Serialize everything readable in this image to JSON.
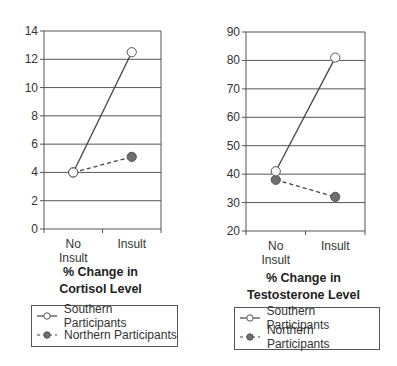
{
  "chart_data": [
    {
      "type": "line",
      "title": "% Change in Cortisol Level",
      "title_lines": [
        "% Change in",
        "Cortisol Level"
      ],
      "xlabel": "",
      "ylabel": "",
      "categories": [
        "No Insult",
        "Insult"
      ],
      "category_lines": [
        [
          "No",
          "Insult"
        ],
        [
          "Insult"
        ]
      ],
      "ylim": [
        0,
        14
      ],
      "yticks": [
        0,
        2,
        4,
        6,
        8,
        10,
        12,
        14
      ],
      "grid": true,
      "legend_position": "bottom",
      "series": [
        {
          "name": "Southern Participants",
          "values": [
            4,
            12.5
          ],
          "marker": "open-circle",
          "line": "solid"
        },
        {
          "name": "Northern Participants",
          "values": [
            4,
            5.1
          ],
          "marker": "filled-circle",
          "line": "dashed"
        }
      ]
    },
    {
      "type": "line",
      "title": "% Change in Testosterone Level",
      "title_lines": [
        "% Change in",
        "Testosterone Level"
      ],
      "xlabel": "",
      "ylabel": "",
      "categories": [
        "No Insult",
        "Insult"
      ],
      "category_lines": [
        [
          "No",
          "Insult"
        ],
        [
          "Insult"
        ]
      ],
      "ylim": [
        20,
        90
      ],
      "yticks": [
        20,
        30,
        40,
        50,
        60,
        70,
        80,
        90
      ],
      "grid": true,
      "legend_position": "bottom",
      "series": [
        {
          "name": "Southern Participants",
          "values": [
            41,
            81
          ],
          "marker": "open-circle",
          "line": "solid"
        },
        {
          "name": "Northern Participants",
          "values": [
            38,
            32
          ],
          "marker": "filled-circle",
          "line": "dashed"
        }
      ]
    }
  ],
  "legend": {
    "southern": "Southern Participants",
    "northern": "Northern Participants"
  },
  "colors": {
    "line": "#444444",
    "grid": "#555555",
    "filled_marker": "#6e6e6e",
    "open_marker_fill": "#ffffff"
  }
}
